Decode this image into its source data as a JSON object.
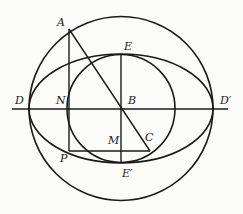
{
  "diagram": {
    "type": "geometry-construction",
    "stroke_color": "#1a1a1a",
    "background": "#fbfbf9",
    "center": {
      "x": 121,
      "y": 108.5
    },
    "outer_circle_radius": 92,
    "inner_circle_radius": 54,
    "ellipse": {
      "rx": 92,
      "ry": 54.5
    },
    "points": [
      {
        "id": "A",
        "label": "A",
        "x": 69,
        "y": 29,
        "lx": 57,
        "ly": 26
      },
      {
        "id": "E",
        "label": "E",
        "x": 121,
        "y": 54,
        "lx": 124,
        "ly": 50
      },
      {
        "id": "D",
        "label": "D",
        "x": 29,
        "y": 109,
        "lx": 15,
        "ly": 104
      },
      {
        "id": "N",
        "label": "N",
        "x": 69,
        "y": 109,
        "lx": 56,
        "ly": 104
      },
      {
        "id": "B",
        "label": "B",
        "x": 121,
        "y": 109,
        "lx": 128,
        "ly": 104
      },
      {
        "id": "D2",
        "label": "D′",
        "x": 213,
        "y": 109,
        "lx": 220,
        "ly": 104
      },
      {
        "id": "C",
        "label": "C",
        "x": 150,
        "y": 151,
        "lx": 145,
        "ly": 141
      },
      {
        "id": "M",
        "label": "M",
        "x": 121,
        "y": 151,
        "lx": 108,
        "ly": 144
      },
      {
        "id": "P",
        "label": "P",
        "x": 69,
        "y": 151,
        "lx": 60,
        "ly": 162
      },
      {
        "id": "E2",
        "label": "E′",
        "x": 121,
        "y": 163,
        "lx": 122,
        "ly": 177
      }
    ],
    "segments": [
      {
        "from": [
          12,
          109
        ],
        "to": [
          228,
          109
        ],
        "name": "major-axis-line"
      },
      {
        "from": [
          69,
          29
        ],
        "to": [
          69,
          151
        ],
        "name": "segment-AP"
      },
      {
        "from": [
          69,
          29
        ],
        "to": [
          150,
          151
        ],
        "name": "segment-AC"
      },
      {
        "from": [
          121,
          54
        ],
        "to": [
          121,
          163
        ],
        "name": "segment-EE2"
      },
      {
        "from": [
          69,
          151
        ],
        "to": [
          150,
          151
        ],
        "name": "segment-PC"
      }
    ]
  }
}
